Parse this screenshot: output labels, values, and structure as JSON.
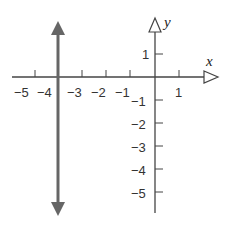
{
  "diagram": {
    "type": "coordinate-plane",
    "axes": {
      "x_label": "x",
      "y_label": "y",
      "color": "#444444"
    },
    "x_ticks": [
      {
        "value": -5,
        "label": "−5"
      },
      {
        "value": -4,
        "label": "−4"
      },
      {
        "value": -3,
        "label": "−3"
      },
      {
        "value": -2,
        "label": "−2"
      },
      {
        "value": -1,
        "label": "−1"
      },
      {
        "value": 1,
        "label": "1"
      }
    ],
    "y_ticks": [
      {
        "value": 1,
        "label": "1"
      },
      {
        "value": -1,
        "label": "−1"
      },
      {
        "value": -2,
        "label": "−2"
      },
      {
        "value": -3,
        "label": "−3"
      },
      {
        "value": -4,
        "label": "−4"
      },
      {
        "value": -5,
        "label": "−5"
      }
    ],
    "graphed_line": {
      "equation": "x = -4",
      "orientation": "vertical",
      "x_value": -4,
      "color": "#666666"
    }
  }
}
